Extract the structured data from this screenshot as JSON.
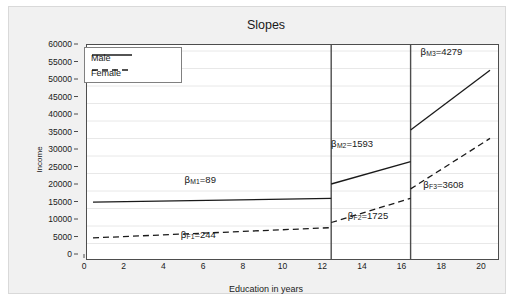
{
  "chart_data": {
    "type": "line",
    "title": "Slopes",
    "xlabel": "Education in years",
    "ylabel": "Income",
    "xlim": [
      0,
      20
    ],
    "ylim": [
      0,
      60000
    ],
    "xticks": [
      0,
      2,
      4,
      6,
      8,
      10,
      12,
      14,
      16,
      18,
      20
    ],
    "xtick_labels": [
      "0",
      "2",
      "4",
      "6",
      "8",
      "10",
      "12",
      "14",
      "16",
      "18",
      "20"
    ],
    "yticks": [
      0,
      5000,
      10000,
      15000,
      20000,
      25000,
      30000,
      35000,
      40000,
      45000,
      50000,
      55000,
      60000
    ],
    "ytick_labels": [
      "0",
      "5000",
      "10000",
      "15000",
      "20000",
      "25000",
      "30000",
      "35000",
      "40000",
      "45000",
      "50000",
      "55000",
      "60000"
    ],
    "grid": true,
    "grid_axis": "y",
    "legend_position": "top-left",
    "knots": [
      12,
      16
    ],
    "series": [
      {
        "name": "Male",
        "style": "solid",
        "color": "#1a1a1a",
        "segments": [
          {
            "x": [
              0,
              12
            ],
            "y": [
              16800,
              17868
            ]
          },
          {
            "x": [
              12,
              16
            ],
            "y": [
              22000,
              28372
            ]
          },
          {
            "x": [
              16,
              20
            ],
            "y": [
              37400,
              54516
            ]
          }
        ]
      },
      {
        "name": "Female",
        "style": "dashed",
        "color": "#1a1a1a",
        "segments": [
          {
            "x": [
              0,
              12
            ],
            "y": [
              6600,
              9528
            ]
          },
          {
            "x": [
              12,
              16
            ],
            "y": [
              11000,
              17900
            ]
          },
          {
            "x": [
              16,
              20
            ],
            "y": [
              20600,
              35032
            ]
          }
        ]
      }
    ],
    "annotations": [
      {
        "name": "beta-m1",
        "beta": "β",
        "sub": "M1",
        "text": "=89",
        "value": 89,
        "x_data": 5.85,
        "y_data": 21100,
        "series": "Male"
      },
      {
        "name": "beta-f1",
        "beta": "β",
        "sub": "F1",
        "text": "=244",
        "value": 244,
        "x_data": 5.75,
        "y_data": 5300,
        "series": "Female"
      },
      {
        "name": "beta-m2",
        "beta": "β",
        "sub": "M2",
        "text": "=1593",
        "value": 1593,
        "x_data": 13.5,
        "y_data": 31400,
        "series": "Male"
      },
      {
        "name": "beta-f2",
        "beta": "β",
        "sub": "F2",
        "text": "=1725",
        "value": 1725,
        "x_data": 14.3,
        "y_data": 11000,
        "series": "Female"
      },
      {
        "name": "beta-m3",
        "beta": "β",
        "sub": "M3",
        "text": "=4279",
        "value": 4279,
        "x_data": 18.0,
        "y_data": 57800,
        "series": "Male"
      },
      {
        "name": "beta-f3",
        "beta": "β",
        "sub": "F3",
        "text": "=3608",
        "value": 3608,
        "x_data": 18.1,
        "y_data": 19600,
        "series": "Female"
      }
    ]
  },
  "legend": {
    "items": [
      {
        "label": "Male",
        "style": "solid"
      },
      {
        "label": "Female",
        "style": "dashed"
      }
    ]
  }
}
